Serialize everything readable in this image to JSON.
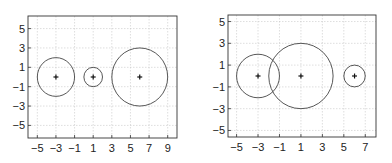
{
  "chart_data": [
    {
      "type": "scatter",
      "title": "",
      "xlabel": "",
      "ylabel": "",
      "xlim": [
        -6,
        10
      ],
      "ylim": [
        -6.3,
        6.3
      ],
      "xticks": [
        -5,
        -3,
        -1,
        1,
        3,
        5,
        7,
        9
      ],
      "yticks": [
        5,
        3,
        1,
        -1,
        -3,
        -5
      ],
      "grid": true,
      "legend": null,
      "circles": [
        {
          "cx": -3,
          "cy": 0,
          "r": 2
        },
        {
          "cx": 1,
          "cy": 0,
          "r": 1
        },
        {
          "cx": 6,
          "cy": 0,
          "r": 3
        }
      ],
      "center_markers": [
        {
          "x": -3,
          "y": 0,
          "marker": "+"
        },
        {
          "x": 1,
          "y": 0,
          "marker": "+"
        },
        {
          "x": 6,
          "y": 0,
          "marker": "+"
        }
      ]
    },
    {
      "type": "scatter",
      "title": "",
      "xlabel": "",
      "ylabel": "",
      "xlim": [
        -5.8,
        8
      ],
      "ylim": [
        -5.6,
        5.6
      ],
      "xticks": [
        -5,
        -3,
        -1,
        1,
        3,
        5,
        7
      ],
      "yticks": [
        5,
        3,
        1,
        -1,
        -3,
        -5
      ],
      "grid": true,
      "legend": null,
      "circles": [
        {
          "cx": -3,
          "cy": 0,
          "r": 2
        },
        {
          "cx": 1,
          "cy": 0,
          "r": 3
        },
        {
          "cx": 6,
          "cy": 0,
          "r": 1
        }
      ],
      "center_markers": [
        {
          "x": -3,
          "y": 0,
          "marker": "+"
        },
        {
          "x": 1,
          "y": 0,
          "marker": "+"
        },
        {
          "x": 6,
          "y": 0,
          "marker": "+"
        }
      ]
    }
  ],
  "panels": [
    {
      "box": {
        "left": 28,
        "top": 16,
        "right": 177,
        "bottom": 138
      }
    },
    {
      "box": {
        "left": 228,
        "top": 15,
        "right": 376,
        "bottom": 137
      }
    }
  ]
}
